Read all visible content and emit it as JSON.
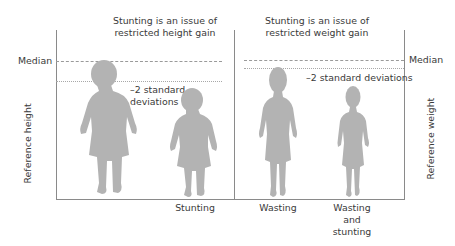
{
  "left_panel": {
    "title_line1": "Stunting is an issue of",
    "title_line2": "restricted height gain",
    "median_label": "Median",
    "sd_label_line1": "–2 standard",
    "sd_label_line2": "deviations",
    "axis_label": "Reference height",
    "figures": [
      {
        "label": "",
        "role": "reference child"
      },
      {
        "label": "Stunting",
        "role": "stunted child"
      }
    ]
  },
  "right_panel": {
    "title_line1": "Stunting is an issue of",
    "title_line2": "restricted weight gain",
    "median_label": "Median",
    "sd_label": "–2 standard deviations",
    "axis_label": "Reference weight",
    "figures": [
      {
        "label_line1": "Wasting",
        "role": "wasted child"
      },
      {
        "label_line1": "Wasting",
        "label_line2": "and",
        "label_line3": "stunting",
        "role": "wasted and stunted child"
      }
    ]
  },
  "colors": {
    "silhouette": "#b3b3b3",
    "axis": "#8a8a8a",
    "text": "#3a3a3a"
  }
}
